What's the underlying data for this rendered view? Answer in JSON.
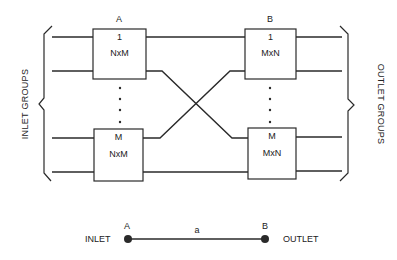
{
  "diagram": {
    "stage_a_label": "A",
    "stage_b_label": "B",
    "boxes": {
      "a_top": {
        "index": "1",
        "type": "NxM"
      },
      "a_bottom": {
        "index": "M",
        "type": "NxM"
      },
      "b_top": {
        "index": "1",
        "type": "MxN"
      },
      "b_bottom": {
        "index": "M",
        "type": "MxN"
      }
    },
    "left_group_label": "INLET GROUPS",
    "right_group_label": "OUTLET GROUPS"
  },
  "legend": {
    "inlet_label": "INLET",
    "outlet_label": "OUTLET",
    "node_a": "A",
    "node_b": "B",
    "link_label": "a"
  },
  "colors": {
    "stroke": "#2a2a2a",
    "background": "#ffffff"
  }
}
